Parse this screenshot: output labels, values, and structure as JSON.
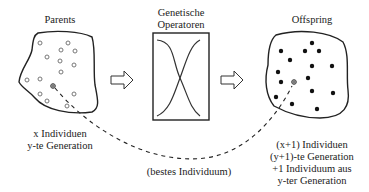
{
  "diagram": {
    "parents": {
      "title": "Parents",
      "caption_line1": "x Individuen",
      "caption_line2": "y-te Generation",
      "marker_style": "hollow-circle"
    },
    "operators": {
      "title_line1": "Genetische",
      "title_line2": "Operatoren"
    },
    "offspring": {
      "title": "Offspring",
      "caption_line1": "(x+1) Individuen",
      "caption_line2": "(y+1)-te Generation",
      "caption_line3": "+1 Individuum aus",
      "caption_line4": "y-ter Generation",
      "marker_style": "filled-dot"
    },
    "best_link_label": "(bestes Individuum)",
    "colors": {
      "stroke": "#222222",
      "background": "#ffffff",
      "hollow_marker": "#777777"
    }
  }
}
